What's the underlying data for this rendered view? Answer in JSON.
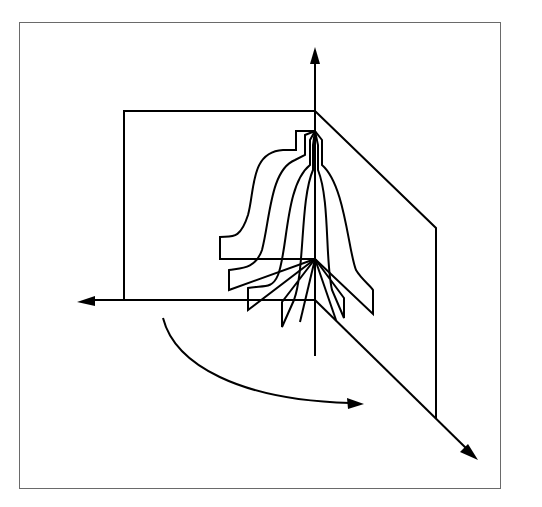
{
  "diagram": {
    "title": "",
    "colors": {
      "stroke": "#000000",
      "background": "#ffffff",
      "frame": "#6a6a6a"
    },
    "elements": [
      "vertical-axis",
      "left-axis",
      "diagonal-axis",
      "back-plane",
      "side-plane",
      "bell-profiles",
      "rotation-arrow"
    ]
  }
}
